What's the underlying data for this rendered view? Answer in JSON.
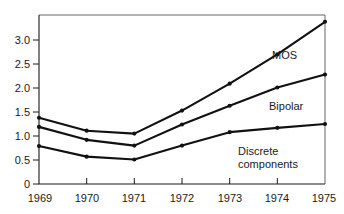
{
  "chart_data": {
    "type": "line",
    "title": "",
    "subtitle": "",
    "xlabel": "",
    "ylabel": "",
    "categories": [
      "1969",
      "1970",
      "1971",
      "1972",
      "1973",
      "1974",
      "1975"
    ],
    "x": [
      1969,
      1970,
      1971,
      1972,
      1973,
      1974,
      1975
    ],
    "xlim": [
      1969,
      1975
    ],
    "ylim": [
      0,
      3.45
    ],
    "yticks": [
      "0",
      "0.5",
      "1.0",
      "1.5",
      "2.0",
      "2.5",
      "3.0"
    ],
    "ytick_values": [
      0,
      0.5,
      1.0,
      1.5,
      2.0,
      2.5,
      3.0
    ],
    "grid": false,
    "legend_position": "inline-right",
    "markers": true,
    "line_color": "#111111",
    "series": [
      {
        "name": "MOS",
        "label": "MOS",
        "values": [
          1.38,
          1.11,
          1.05,
          1.53,
          2.09,
          2.7,
          3.38
        ]
      },
      {
        "name": "Bipolar",
        "label": "Bipolar",
        "values": [
          1.19,
          0.92,
          0.8,
          1.24,
          1.63,
          2.01,
          2.28
        ]
      },
      {
        "name": "Discrete components",
        "label": "Discrete components",
        "label_line1": "Discrete",
        "label_line2": "components",
        "values": [
          0.79,
          0.57,
          0.51,
          0.8,
          1.08,
          1.17,
          1.25
        ]
      }
    ],
    "annotations": [
      {
        "text": "MOS",
        "series": "MOS"
      },
      {
        "text": "Bipolar",
        "series": "Bipolar"
      },
      {
        "text": "Discrete components",
        "series": "Discrete components"
      }
    ]
  }
}
